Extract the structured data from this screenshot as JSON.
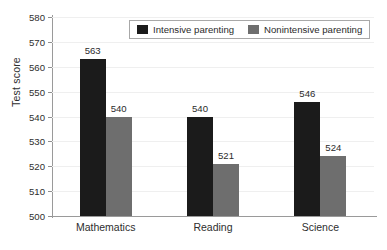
{
  "chart_data": {
    "type": "bar",
    "title": "",
    "subtitle": "",
    "xlabel": "",
    "ylabel": "Test score",
    "ylim": [
      500,
      580
    ],
    "ytick_step": 10,
    "yticks": [
      500,
      510,
      520,
      530,
      540,
      550,
      560,
      570,
      580
    ],
    "ytick_labels": [
      "500",
      "510",
      "520",
      "530",
      "540",
      "550",
      "560",
      "570",
      "580"
    ],
    "grid": "horizontal",
    "legend_position": "top-center",
    "categories": [
      "Mathematics",
      "Reading",
      "Science"
    ],
    "series": [
      {
        "name": "Intensive parenting",
        "color": "#1b1b1b",
        "values": [
          563,
          540,
          546
        ],
        "value_labels": [
          "563",
          "540",
          "546"
        ]
      },
      {
        "name": "Nonintensive parenting",
        "color": "#6e6e6e",
        "values": [
          540,
          521,
          524
        ],
        "value_labels": [
          "540",
          "521",
          "524"
        ]
      }
    ],
    "annotations": []
  },
  "legend": {
    "entries": [
      {
        "label": "Intensive parenting",
        "swatch": "black-swatch-icon"
      },
      {
        "label": "Nonintensive parenting",
        "swatch": "gray-swatch-icon"
      }
    ]
  },
  "colors": {
    "series_intensive": "#1b1b1b",
    "series_nonintensive": "#6e6e6e",
    "axis": "#9a9a9a",
    "gridline": "#efefef",
    "text": "#2b2b2b",
    "background": "#ffffff"
  }
}
